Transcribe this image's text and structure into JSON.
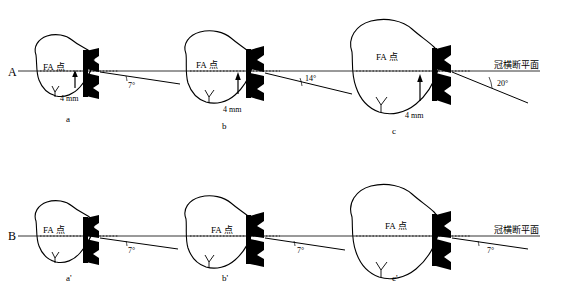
{
  "figure": {
    "type": "anatomical-schematic",
    "panels": [
      {
        "id": "A",
        "letter": "A",
        "axis_label": "冠横断平面",
        "subfigures": [
          {
            "id": "a",
            "caption": "a",
            "fa_label": "FA 点",
            "distance": "4 mm",
            "angle": "7°"
          },
          {
            "id": "b",
            "caption": "b",
            "fa_label": "FA 点",
            "distance": "4 mm",
            "angle": "14°"
          },
          {
            "id": "c",
            "caption": "c",
            "fa_label": "FA 点",
            "distance": "4 mm",
            "angle": "20°"
          }
        ]
      },
      {
        "id": "B",
        "letter": "B",
        "axis_label": "冠横断平面",
        "subfigures": [
          {
            "id": "a2",
            "caption": "a'",
            "fa_label": "FA 点",
            "distance": "",
            "angle": "7°"
          },
          {
            "id": "b2",
            "caption": "b'",
            "fa_label": "FA 点",
            "distance": "",
            "angle": "7°"
          },
          {
            "id": "c2",
            "caption": "c'",
            "fa_label": "FA 点",
            "distance": "",
            "angle": "7°"
          }
        ]
      }
    ]
  },
  "colors": {
    "stroke": "#000000",
    "background": "#ffffff",
    "bracket": "#000000"
  }
}
